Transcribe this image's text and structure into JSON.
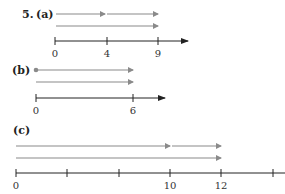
{
  "problem_number": "5.",
  "colors": {
    "vector": "#8a8a8a",
    "axis": "#333333",
    "text": "#222222"
  },
  "parts": [
    {
      "label": "(a)",
      "vectors_row1": [
        {
          "from": 0,
          "to": 4
        },
        {
          "from": 4,
          "to": 9
        }
      ],
      "vectors_row2": [
        {
          "from": 0,
          "to": 9
        }
      ],
      "axis_ticks": [
        "0",
        "4",
        "9"
      ]
    },
    {
      "label": "(b)",
      "start_dot": true,
      "vectors_row1": [
        {
          "from": 0,
          "to": 6
        }
      ],
      "vectors_row2": [
        {
          "from": 0,
          "to": 6
        }
      ],
      "axis_ticks": [
        "0",
        "6"
      ]
    },
    {
      "label": "(c)",
      "vectors_row1": [
        {
          "from": 0,
          "to": 10
        },
        {
          "from": 10,
          "to": 12
        }
      ],
      "vectors_row2": [
        {
          "from": 0,
          "to": 12
        }
      ],
      "axis_ticks": [
        "0",
        "10",
        "12"
      ]
    }
  ]
}
